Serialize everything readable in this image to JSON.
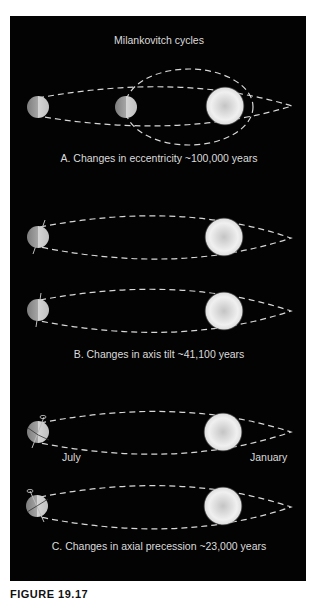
{
  "figure": {
    "title": "Milankovitch cycles",
    "caption": "FIGURE 19.17",
    "colors": {
      "background": "#030303",
      "text": "#dcdcdc",
      "orbit": "#d8d8d8",
      "sun": "#f2f2f2",
      "earth": "#9a9a9a"
    }
  },
  "sections": [
    {
      "id": "A",
      "label": "A. Changes in eccentricity ~100,000 years",
      "elements": [
        "earth",
        "earth",
        "sun",
        "elliptical-orbit",
        "circular-orbit"
      ]
    },
    {
      "id": "B",
      "label": "B. Changes in axis tilt ~41,100 years",
      "elements": [
        "earth-tilt-1",
        "earth-tilt-2",
        "sun",
        "orbit"
      ]
    },
    {
      "id": "C",
      "label": "C. Changes in axial precession ~23,000 years",
      "month_labels": {
        "left": "July",
        "right": "January"
      },
      "elements": [
        "earth-precession-1",
        "earth-precession-2",
        "sun",
        "orbit"
      ]
    }
  ]
}
